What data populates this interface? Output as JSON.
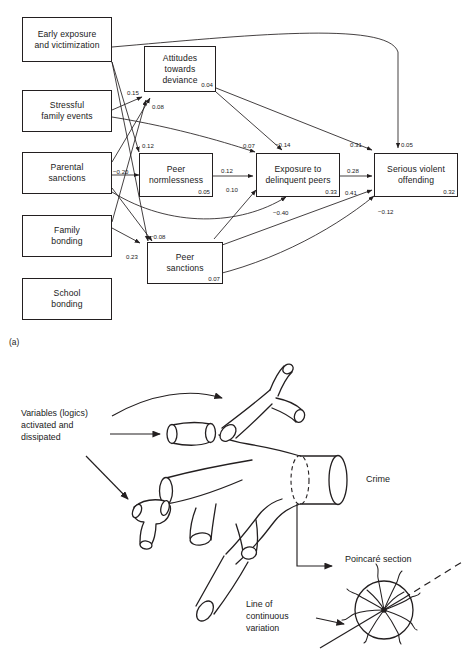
{
  "figure": {
    "panel_a_label": "(a)",
    "cropped_title": "",
    "nodes": [
      {
        "id": "early-exposure",
        "label": "Early exposure\nand victimization",
        "r2": ""
      },
      {
        "id": "stressful-family",
        "label": "Stressful\nfamily events",
        "r2": ""
      },
      {
        "id": "parental-sanctions",
        "label": "Parental\nsanctions",
        "r2": ""
      },
      {
        "id": "family-bonding",
        "label": "Family\nbonding",
        "r2": ""
      },
      {
        "id": "school-bonding",
        "label": "School\nbonding",
        "r2": ""
      },
      {
        "id": "attitudes-deviance",
        "label": "Attitudes\ntowards\ndeviance",
        "r2": "0.04"
      },
      {
        "id": "peer-normlessness",
        "label": "Peer\nnormlessness",
        "r2": "0.05"
      },
      {
        "id": "peer-sanctions",
        "label": "Peer\nsanctions",
        "r2": "0.07"
      },
      {
        "id": "exposure-delinquent",
        "label": "Exposure to\ndelinquent peers",
        "r2": "0.33"
      },
      {
        "id": "serious-violent",
        "label": "Serious violent\noffending",
        "r2": "0.32"
      }
    ],
    "path_coefficients": [
      {
        "id": "c-0-15",
        "value": "0.15"
      },
      {
        "id": "c-0-08",
        "value": "0.08"
      },
      {
        "id": "c-0-12-left",
        "value": "0.12"
      },
      {
        "id": "c-neg-0-20",
        "value": "−0.20"
      },
      {
        "id": "c-0-23",
        "value": "0.23"
      },
      {
        "id": "c-neg-0-08",
        "value": "−0.08"
      },
      {
        "id": "c-0-07",
        "value": "0.07"
      },
      {
        "id": "c-neg-0-14",
        "value": "−0.14"
      },
      {
        "id": "c-0-31",
        "value": "0.31"
      },
      {
        "id": "c-0-05",
        "value": "0.05"
      },
      {
        "id": "c-0-12-mid",
        "value": "0.12"
      },
      {
        "id": "c-0-28",
        "value": "0.28"
      },
      {
        "id": "c-0-10",
        "value": "0.10"
      },
      {
        "id": "c-0-41",
        "value": "0.41"
      },
      {
        "id": "c-neg-0-40",
        "value": "−0.40"
      },
      {
        "id": "c-neg-0-12",
        "value": "−0.12"
      }
    ]
  },
  "chaos": {
    "annotations": [
      {
        "id": "variables",
        "text": "Variables (logics)\nactivated and\ndissipated"
      },
      {
        "id": "crime",
        "text": "Crime"
      },
      {
        "id": "poincare",
        "text": "Poincaré section"
      },
      {
        "id": "line-cont",
        "text": "Line of\ncontinuous\nvariation"
      }
    ]
  },
  "colors": {
    "ink": "#231f20",
    "paper": "#ffffff"
  }
}
